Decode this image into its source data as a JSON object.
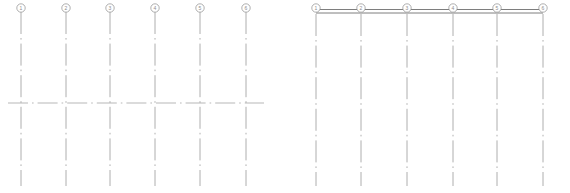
{
  "drawing": {
    "title": "Structural Grid Plan Fragments",
    "background_color": "#ffffff",
    "line_color": "#9a9a9a",
    "bubble_stroke_color": "#8d8d8d",
    "bubble_fill_color": "#ffffff",
    "wall_color": "#6f6f6f",
    "axis_color": "#a5a5a5",
    "canvas": {
      "width": 570,
      "height": 193
    }
  },
  "grid_groups": [
    {
      "id": "left-grid-group",
      "name": "left-grid-fragment",
      "bubbles": [
        {
          "label": "1",
          "cx": 21,
          "cy": 8,
          "r": 4.2
        },
        {
          "label": "2",
          "cx": 66,
          "cy": 8,
          "r": 4.2
        },
        {
          "label": "3",
          "cx": 110,
          "cy": 8,
          "r": 4.2
        },
        {
          "label": "4",
          "cx": 155,
          "cy": 8,
          "r": 4.2
        },
        {
          "label": "5",
          "cx": 200,
          "cy": 8,
          "r": 4.2
        },
        {
          "label": "6",
          "cx": 246,
          "cy": 8,
          "r": 4.2
        }
      ],
      "vertical_lines": [
        {
          "x": 21,
          "y1": 12,
          "y2": 186
        },
        {
          "x": 66,
          "y1": 12,
          "y2": 186
        },
        {
          "x": 110,
          "y1": 12,
          "y2": 186
        },
        {
          "x": 155,
          "y1": 12,
          "y2": 186
        },
        {
          "x": 200,
          "y1": 12,
          "y2": 186
        },
        {
          "x": 246,
          "y1": 12,
          "y2": 186
        }
      ],
      "horizontal_lines": [
        {
          "y": 103,
          "x1": 8,
          "x2": 264
        }
      ],
      "walls": []
    },
    {
      "id": "right-grid-group",
      "name": "right-grid-fragment",
      "bubbles": [
        {
          "label": "1",
          "cx": 316,
          "cy": 8,
          "r": 4.2
        },
        {
          "label": "2",
          "cx": 361,
          "cy": 8,
          "r": 4.2
        },
        {
          "label": "3",
          "cx": 407,
          "cy": 8,
          "r": 4.2
        },
        {
          "label": "4",
          "cx": 453,
          "cy": 8,
          "r": 4.2
        },
        {
          "label": "5",
          "cx": 497,
          "cy": 8,
          "r": 4.2
        },
        {
          "label": "6",
          "cx": 543,
          "cy": 8,
          "r": 4.2
        }
      ],
      "vertical_lines": [
        {
          "x": 316,
          "y1": 14,
          "y2": 186
        },
        {
          "x": 361,
          "y1": 14,
          "y2": 186
        },
        {
          "x": 407,
          "y1": 14,
          "y2": 186
        },
        {
          "x": 453,
          "y1": 14,
          "y2": 186
        },
        {
          "x": 497,
          "y1": 14,
          "y2": 186
        },
        {
          "x": 543,
          "y1": 14,
          "y2": 186
        }
      ],
      "horizontal_lines": [],
      "walls": [
        {
          "x1": 316,
          "x2": 543,
          "y_top": 9.5,
          "y_bottom": 13
        }
      ]
    }
  ]
}
